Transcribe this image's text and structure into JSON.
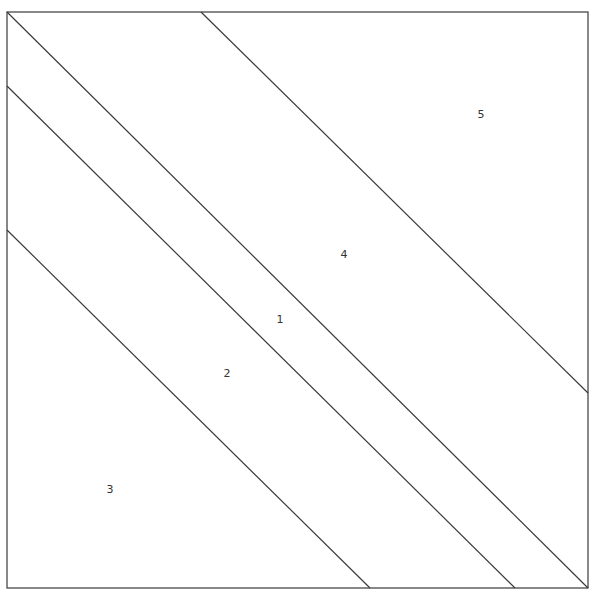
{
  "diagram": {
    "title": "",
    "frame": {
      "x1": 7,
      "y1": 12,
      "x2": 588,
      "y2": 588
    },
    "stroke_color": "#3a3a3a",
    "background": "#ffffff",
    "lines": [
      {
        "id": "line-a",
        "x1": 201,
        "y1": 12,
        "x2": 588,
        "y2": 393
      },
      {
        "id": "line-b",
        "x1": 7,
        "y1": 12,
        "x2": 588,
        "y2": 588
      },
      {
        "id": "line-c",
        "x1": 7,
        "y1": 86,
        "x2": 515,
        "y2": 588
      },
      {
        "id": "line-d",
        "x1": 7,
        "y1": 230,
        "x2": 370,
        "y2": 588
      }
    ],
    "regions": [
      {
        "label": "1",
        "x": 280,
        "y": 323
      },
      {
        "label": "2",
        "x": 227,
        "y": 377
      },
      {
        "label": "3",
        "x": 110,
        "y": 493
      },
      {
        "label": "4",
        "x": 344,
        "y": 258
      },
      {
        "label": "5",
        "x": 481,
        "y": 118
      }
    ]
  }
}
